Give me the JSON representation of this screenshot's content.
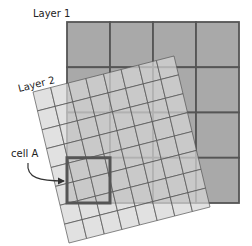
{
  "labels": {
    "layer1": "Layer 1",
    "layer2": "Layer 2",
    "cell": "cell A"
  },
  "layer1": {
    "rows": 4,
    "cols": 4,
    "fill": "#a9a9a9",
    "line": "#555555"
  },
  "layer2": {
    "rows": 8,
    "cols": 8,
    "fill": "#d6d6d6",
    "line": "#555555",
    "rotation_deg": -14.3
  },
  "highlight": {
    "layer": "layer1",
    "row": 3,
    "col": 0,
    "stroke": "#555555"
  },
  "colors": {
    "text": "#222222",
    "arrow": "#333333"
  }
}
